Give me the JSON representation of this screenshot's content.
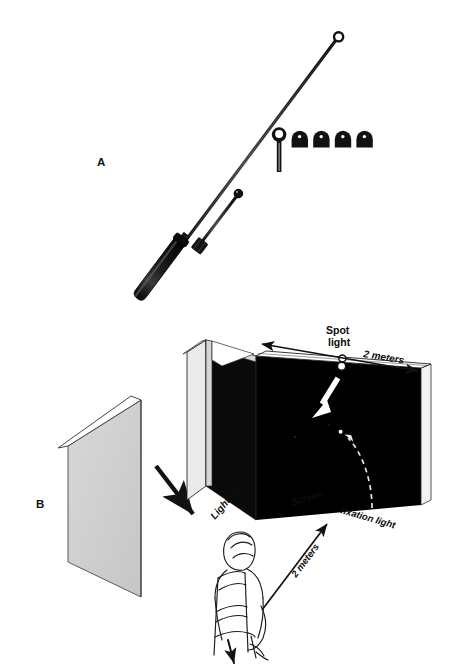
{
  "figure": {
    "width": 459,
    "height": 671,
    "background_color": "#ffffff"
  },
  "panels": [
    {
      "id": "A",
      "label": "A",
      "label_x": 97,
      "label_y": 166,
      "description": "Handheld perimeter wand with white ring tip, shorter black-ball rod, and a set of stimulus accessory caps"
    },
    {
      "id": "B",
      "label": "B",
      "label_x": 36,
      "label_y": 508,
      "description": "Perspective view of the dark screen, light baffle and seated observer"
    }
  ],
  "panel_a": {
    "long_wand": {
      "name": "long-pointer-wand",
      "tip_style": "open-ring",
      "handle_color": "#141414",
      "shaft_color": "#1a1a1a"
    },
    "short_rod": {
      "name": "short-pointer-rod",
      "tip_style": "solid-ball",
      "shaft_color": "#1a1a1a"
    },
    "accessories": {
      "ring_rod_count": 1,
      "dome_cap_count": 4,
      "color": "#111111"
    }
  },
  "panel_b": {
    "labels": {
      "spot_light_line1": "Spot",
      "spot_light_line2": "light",
      "top_distance": "2 meters",
      "light_baffle": "Light baffle",
      "screen": "Screen",
      "fixation_light": "fixation light",
      "viewing_distance": "2 meters"
    },
    "colors": {
      "screen_black": "#000000",
      "baffle_gray": "#d2d2d2",
      "detached_panel_gray": "#cfcfcf",
      "edge_white": "#ffffff",
      "outline": "#1a1a1a",
      "fixation_dot": "#ffffff"
    },
    "elements": {
      "spot_light": "spot-light-fixture",
      "white_beam_arrow": "spot-light-beam-arrow",
      "fixation_dot": "fixation-light-dot",
      "dashed_pointer": "fixation-light-dashed-arrow",
      "baffle_placement_arrow": "baffle-placement-arrow",
      "observer": "seated-observer",
      "chair": "observer-chair"
    }
  }
}
